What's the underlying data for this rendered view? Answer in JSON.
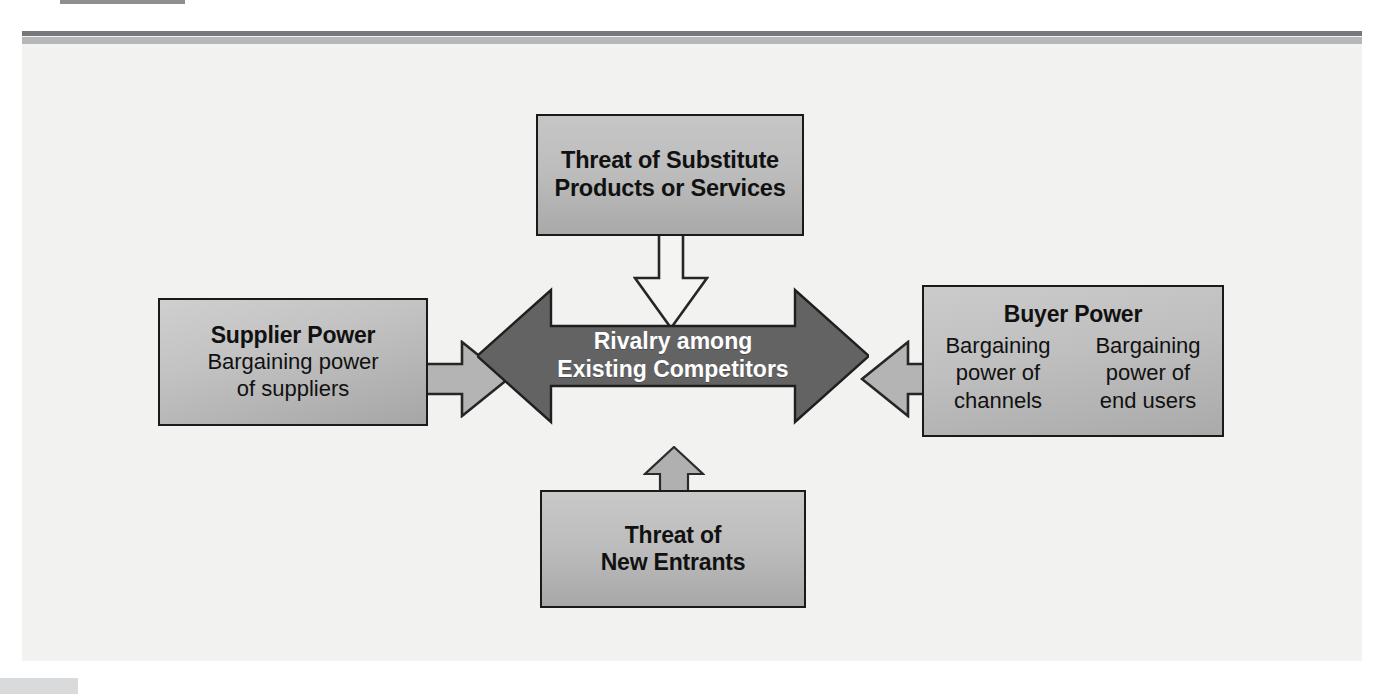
{
  "diagram": {
    "type": "five-forces",
    "colors": {
      "panel_background": "#f2f2f0",
      "rule_dark": "#77787b",
      "rule_light": "#b6b7b9",
      "box_fill_light": "#cccccc",
      "box_fill_dark": "#a8a8a8",
      "box_border": "#1a1a1a",
      "center_arrow_fill": "#636363",
      "center_arrow_text": "#ffffff",
      "connector_light_fill": "#f4f4f2",
      "connector_gray_fill": "#b4b4b4",
      "text": "#111111"
    },
    "center": {
      "line1": "Rivalry among",
      "line2": "Existing Competitors"
    },
    "forces": {
      "substitutes": {
        "line1": "Threat of Substitute",
        "line2": "Products or Services"
      },
      "new_entrants": {
        "line1": "Threat of",
        "line2": "New Entrants"
      },
      "supplier": {
        "title": "Supplier Power",
        "line1": "Bargaining power",
        "line2": "of suppliers"
      },
      "buyer": {
        "title": "Buyer Power",
        "left_col": {
          "line1": "Bargaining",
          "line2": "power of",
          "line3": "channels"
        },
        "right_col": {
          "line1": "Bargaining",
          "line2": "power of",
          "line3": "end users"
        }
      }
    },
    "connectors": {
      "substitutes_to_center": "arrow-down",
      "entrants_to_center": "arrow-up",
      "supplier_to_center": "arrow-right",
      "buyer_to_center": "arrow-left"
    }
  }
}
